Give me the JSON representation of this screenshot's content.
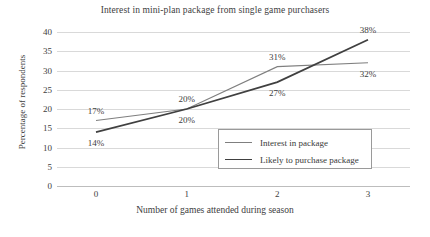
{
  "chart_data": {
    "type": "line",
    "title": "Interest in mini-plan package from single game purchasers",
    "xlabel": "Number of games attended during season",
    "ylabel": "Percentage of respondents",
    "x": [
      0,
      1,
      2,
      3
    ],
    "categories": [
      "0",
      "1",
      "2",
      "3"
    ],
    "xtick_labels": [
      "0",
      "1",
      "2",
      "3"
    ],
    "ytick_labels": [
      "0",
      "5",
      "10",
      "15",
      "20",
      "25",
      "30",
      "35",
      "40"
    ],
    "ytick_values": [
      0,
      5,
      10,
      15,
      20,
      25,
      30,
      35,
      40
    ],
    "ylim": [
      0,
      40
    ],
    "grid": "horizontal",
    "legend_position": "inside-center-right",
    "series": [
      {
        "name": "Interest in package",
        "values": [
          17,
          20,
          31,
          32
        ],
        "data_labels": [
          "17%",
          "20%",
          "31%",
          "32%"
        ],
        "color": "#7f7f7f",
        "width": 1.1
      },
      {
        "name": "Likely to purchase package",
        "values": [
          14,
          20,
          27,
          38
        ],
        "data_labels": [
          "14%",
          "20%",
          "27%",
          "38%"
        ],
        "color": "#404040",
        "width": 1.8
      }
    ],
    "annotations": [
      {
        "text": "17%",
        "x": 0,
        "y": 17,
        "place": "above"
      },
      {
        "text": "14%",
        "x": 0,
        "y": 14,
        "place": "below"
      },
      {
        "text": "20%",
        "x": 1,
        "y": 20,
        "place": "above"
      },
      {
        "text": "20%",
        "x": 1,
        "y": 20,
        "place": "below"
      },
      {
        "text": "31%",
        "x": 2,
        "y": 31,
        "place": "above"
      },
      {
        "text": "27%",
        "x": 2,
        "y": 27,
        "place": "below"
      },
      {
        "text": "38%",
        "x": 3,
        "y": 38,
        "place": "above"
      },
      {
        "text": "32%",
        "x": 3,
        "y": 32,
        "place": "below"
      }
    ]
  },
  "legend": {
    "items": [
      {
        "label": "Interest in package"
      },
      {
        "label": "Likely to purchase package"
      }
    ]
  }
}
